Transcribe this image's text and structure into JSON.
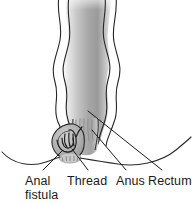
{
  "figure": {
    "kind": "medical-illustration",
    "background_color": "#ffffff",
    "ink_color": "#1a1a1a"
  },
  "labels": {
    "anal": "Anal",
    "fistula": "fistula",
    "thread": "Thread",
    "anus": "Anus",
    "rectum": "Rectum"
  },
  "structures": [
    {
      "name": "rectum",
      "label": "Rectum",
      "description": "Vertical wavy-walled tube with gray gradient shading occupying the upper two-thirds of the figure",
      "fill_light": "#e6e6e6",
      "fill_mid": "#b5b5b5",
      "fill_dark": "#8f8f8f"
    },
    {
      "name": "anus",
      "label": "Anus",
      "description": "Narrow canal at the base of the rectum showing vertical anal columns",
      "fill": "#c0c0c0"
    },
    {
      "name": "anal-fistula",
      "label": "Anal fistula",
      "description": "Rounded tract opening on the skin to the left of the anus",
      "fill": "#b8b8b8"
    },
    {
      "name": "thread",
      "label": "Thread",
      "description": "Loop of seton thread passed through the fistula tract and out of the anus",
      "stroke": "#2b2b2b"
    },
    {
      "name": "skin-line",
      "label": "",
      "description": "Perineal skin contour sweeping left and right from the anus",
      "stroke": "#2b2b2b"
    }
  ],
  "leader_lines": [
    {
      "name": "leader-anal-fistula",
      "from_label": "Anal fistula",
      "x1": 43,
      "y1": 170,
      "x2": 62,
      "y2": 152
    },
    {
      "name": "leader-thread",
      "from_label": "Thread",
      "x1": 88,
      "y1": 170,
      "x2": 73,
      "y2": 150
    },
    {
      "name": "leader-anus",
      "from_label": "Anus",
      "x1": 126,
      "y1": 170,
      "x2": 92,
      "y2": 131
    },
    {
      "name": "leader-rectum",
      "from_label": "Rectum",
      "x1": 162,
      "y1": 170,
      "x2": 88,
      "y2": 112
    }
  ]
}
